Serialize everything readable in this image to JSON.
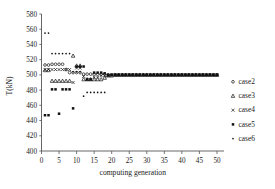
{
  "chart_data": {
    "type": "scatter",
    "title": "",
    "xlabel": "computing generation",
    "ylabel": "T(kN)",
    "xlim": [
      0,
      52
    ],
    "ylim": [
      400,
      580
    ],
    "xticks": [
      0,
      5,
      10,
      15,
      20,
      25,
      30,
      35,
      40,
      45,
      50
    ],
    "yticks": [
      400,
      420,
      440,
      460,
      480,
      500,
      520,
      540,
      560,
      580
    ],
    "grid": false,
    "legend_position": "right",
    "series": [
      {
        "name": "case2",
        "marker": "circle-open",
        "x": [
          1,
          2,
          3,
          4,
          5,
          6,
          7,
          8,
          9,
          10,
          11,
          12,
          13,
          14,
          15,
          16,
          17,
          18,
          19,
          20,
          21,
          22,
          23,
          24,
          25,
          26,
          27,
          28,
          29,
          30,
          31,
          32,
          33,
          34,
          35,
          36,
          37,
          38,
          39,
          40,
          41,
          42,
          43,
          44,
          45,
          46,
          47,
          48,
          49,
          50
        ],
        "y": [
          513,
          513,
          514,
          514,
          514,
          514,
          507,
          503,
          503,
          503,
          503,
          501,
          501,
          501,
          501,
          501,
          501,
          501,
          500,
          500,
          500,
          500,
          500,
          500,
          500,
          500,
          500,
          500,
          500,
          500,
          500,
          500,
          500,
          500,
          500,
          500,
          500,
          500,
          500,
          500,
          500,
          500,
          500,
          500,
          500,
          500,
          500,
          500,
          500,
          500
        ]
      },
      {
        "name": "case3",
        "marker": "triangle-open",
        "x": [
          1,
          2,
          3,
          4,
          5,
          6,
          7,
          8,
          9,
          10,
          11,
          12,
          13,
          14,
          15,
          16,
          17,
          18,
          19,
          20,
          21,
          22,
          23,
          24,
          25,
          26,
          27,
          28,
          29,
          30,
          31,
          32,
          33,
          34,
          35,
          36,
          37,
          38,
          39,
          40,
          41,
          42,
          43,
          44,
          45,
          46,
          47,
          48,
          49,
          50
        ],
        "y": [
          506,
          506,
          492,
          492,
          492,
          492,
          492,
          492,
          525,
          512,
          512,
          494,
          494,
          494,
          494,
          494,
          494,
          496,
          499,
          499,
          500,
          500,
          500,
          500,
          500,
          500,
          500,
          500,
          500,
          500,
          500,
          500,
          500,
          500,
          500,
          500,
          500,
          500,
          500,
          500,
          500,
          500,
          500,
          500,
          500,
          500,
          500,
          500,
          500,
          500
        ]
      },
      {
        "name": "case4",
        "marker": "x",
        "x": [
          1,
          2,
          3,
          4,
          5,
          6,
          7,
          8,
          9,
          10,
          11,
          12,
          13,
          14,
          15,
          16,
          17,
          18,
          19,
          20,
          21,
          22,
          23,
          24,
          25,
          26,
          27,
          28,
          29,
          30,
          31,
          32,
          33,
          34,
          35,
          36,
          37,
          38,
          39,
          40,
          41,
          42,
          43,
          44,
          45,
          46,
          47,
          48,
          49,
          50
        ],
        "y": [
          507,
          507,
          507,
          507,
          507,
          507,
          507,
          507,
          490,
          509,
          509,
          498,
          494,
          494,
          497,
          497,
          499,
          499,
          499,
          500,
          500,
          500,
          500,
          500,
          500,
          500,
          500,
          500,
          500,
          500,
          500,
          500,
          500,
          500,
          500,
          500,
          500,
          500,
          500,
          500,
          500,
          500,
          500,
          500,
          500,
          500,
          500,
          500,
          500,
          500
        ]
      },
      {
        "name": "case5",
        "marker": "square",
        "x": [
          1,
          2,
          3,
          4,
          5,
          6,
          7,
          8,
          9,
          10,
          11,
          12,
          13,
          14,
          15,
          16,
          17,
          18,
          19,
          20,
          21,
          22,
          23,
          24,
          25,
          26,
          27,
          28,
          29,
          30,
          31,
          32,
          33,
          34,
          35,
          36,
          37,
          38,
          39,
          40,
          41,
          42,
          43,
          44,
          45,
          46,
          47,
          48,
          49,
          50
        ],
        "y": [
          447,
          447,
          481,
          481,
          449,
          481,
          481,
          481,
          456,
          511,
          511,
          511,
          494,
          494,
          503,
          503,
          503,
          502,
          500,
          500,
          500,
          500,
          500,
          500,
          500,
          500,
          500,
          500,
          500,
          500,
          500,
          500,
          500,
          500,
          500,
          500,
          500,
          500,
          500,
          500,
          500,
          500,
          500,
          500,
          500,
          500,
          500,
          500,
          500,
          500
        ]
      },
      {
        "name": "case6",
        "marker": "dot",
        "x": [
          1,
          2,
          3,
          4,
          5,
          6,
          7,
          8,
          9,
          10,
          11,
          12,
          13,
          14,
          15,
          16,
          17,
          18,
          19,
          20,
          21,
          22,
          23,
          24,
          25,
          26,
          27,
          28,
          29,
          30,
          31,
          32,
          33,
          34,
          35,
          36,
          37,
          38,
          39,
          40,
          41,
          42,
          43,
          44,
          45,
          46,
          47,
          48,
          49,
          50
        ],
        "y": [
          555,
          555,
          528,
          528,
          528,
          528,
          528,
          528,
          504,
          504,
          504,
          472,
          477,
          477,
          477,
          477,
          477,
          477,
          499,
          500,
          500,
          500,
          500,
          500,
          500,
          500,
          500,
          500,
          500,
          500,
          500,
          500,
          500,
          500,
          500,
          500,
          500,
          500,
          500,
          500,
          500,
          500,
          500,
          500,
          500,
          500,
          500,
          500,
          500,
          500
        ]
      }
    ]
  },
  "legend": {
    "items": [
      {
        "label": "case2",
        "marker": "circle-open"
      },
      {
        "label": "case3",
        "marker": "triangle-open"
      },
      {
        "label": "case4",
        "marker": "x"
      },
      {
        "label": "case5",
        "marker": "square"
      },
      {
        "label": "case6",
        "marker": "dot"
      }
    ]
  },
  "axes": {
    "y_title": "T(kN)",
    "x_title": "computing generation",
    "y_labels": [
      "580",
      "560",
      "540",
      "520",
      "500",
      "480",
      "460",
      "440",
      "420",
      "400"
    ],
    "x_labels": [
      "0",
      "5",
      "10",
      "15",
      "20",
      "25",
      "30",
      "35",
      "40",
      "45",
      "50"
    ]
  },
  "colors": {
    "marker": "#111111",
    "axis": "#555555",
    "text": "#1a1a1a",
    "background": "#ffffff"
  }
}
